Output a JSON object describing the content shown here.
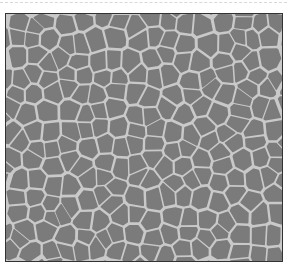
{
  "image": {
    "description": "Grayscale cellular / Voronoi-like texture with gray cells separated by light borders",
    "colors": {
      "cell_fill": "#7b7b7b",
      "cell_border": "#c9c9c9",
      "frame_border": "#333333",
      "background": "#ffffff",
      "dash_line": "#d8d8d8"
    },
    "grid": {
      "cols": 16,
      "rows": 14,
      "seed": 7
    }
  }
}
